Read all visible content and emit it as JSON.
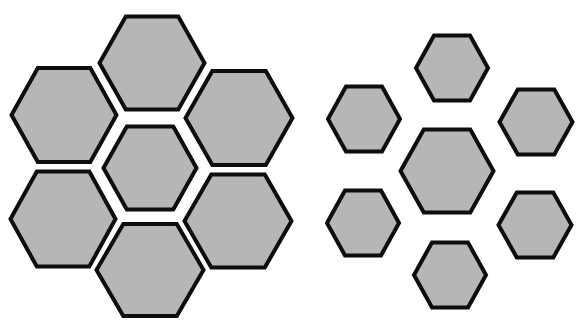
{
  "figure": {
    "title": "",
    "background": "#ffffff",
    "fill_color": "#b6b6b6",
    "stroke_color": "#0d0d0d",
    "clusters": [
      {
        "name": "large-surround-cluster",
        "center": {
          "cx": 150,
          "cy": 168,
          "w": 93,
          "h": 83
        },
        "surround": [
          {
            "cx": 152,
            "cy": 63,
            "w": 105,
            "h": 93
          },
          {
            "cx": 64,
            "cy": 115,
            "w": 105,
            "h": 94
          },
          {
            "cx": 239,
            "cy": 118,
            "w": 107,
            "h": 94
          },
          {
            "cx": 63,
            "cy": 219,
            "w": 105,
            "h": 95
          },
          {
            "cx": 238,
            "cy": 221,
            "w": 107,
            "h": 93
          },
          {
            "cx": 150,
            "cy": 270,
            "w": 107,
            "h": 92
          }
        ]
      },
      {
        "name": "small-surround-cluster",
        "center": {
          "cx": 447,
          "cy": 171,
          "w": 93,
          "h": 83
        },
        "surround": [
          {
            "cx": 452,
            "cy": 68,
            "w": 72,
            "h": 65
          },
          {
            "cx": 364,
            "cy": 119,
            "w": 72,
            "h": 65
          },
          {
            "cx": 536,
            "cy": 122,
            "w": 73,
            "h": 65
          },
          {
            "cx": 363,
            "cy": 223,
            "w": 72,
            "h": 65
          },
          {
            "cx": 535,
            "cy": 225,
            "w": 73,
            "h": 65
          },
          {
            "cx": 450,
            "cy": 275,
            "w": 72,
            "h": 65
          }
        ]
      }
    ]
  }
}
